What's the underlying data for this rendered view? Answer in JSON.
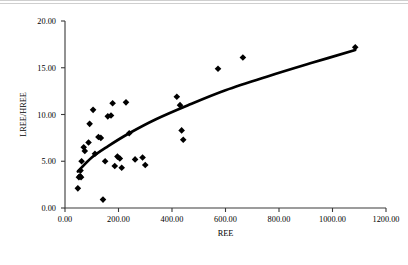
{
  "figure": {
    "background_color": "#ffffff",
    "marker_color": "#000000",
    "trend_color": "#000000",
    "axis_color": "#3a3a3a"
  },
  "chart_data": {
    "type": "scatter",
    "title": "",
    "xlabel": "REE",
    "ylabel": "LREE/HREE",
    "xlim": [
      0,
      1200
    ],
    "ylim": [
      0,
      20
    ],
    "grid": false,
    "legend": null,
    "xticks": [
      0,
      200,
      400,
      600,
      800,
      1000,
      1200
    ],
    "yticks": [
      0,
      5,
      10,
      15,
      20
    ],
    "xtick_labels": [
      "0.00",
      "200.00",
      "400.00",
      "600.00",
      "800.00",
      "1000.00",
      "1200.00"
    ],
    "ytick_labels": [
      "0.00",
      "5.00",
      "10.00",
      "15.00",
      "20.00"
    ],
    "marker_shape": "diamond",
    "points": [
      {
        "x": 48,
        "y": 2.1
      },
      {
        "x": 52,
        "y": 3.3
      },
      {
        "x": 56,
        "y": 3.4
      },
      {
        "x": 58,
        "y": 4.0
      },
      {
        "x": 60,
        "y": 3.3
      },
      {
        "x": 62,
        "y": 5.0
      },
      {
        "x": 70,
        "y": 6.5
      },
      {
        "x": 74,
        "y": 6.1
      },
      {
        "x": 88,
        "y": 7.0
      },
      {
        "x": 92,
        "y": 9.0
      },
      {
        "x": 105,
        "y": 10.5
      },
      {
        "x": 112,
        "y": 5.8
      },
      {
        "x": 125,
        "y": 7.6
      },
      {
        "x": 134,
        "y": 7.5
      },
      {
        "x": 142,
        "y": 0.9
      },
      {
        "x": 150,
        "y": 5.0
      },
      {
        "x": 160,
        "y": 9.8
      },
      {
        "x": 172,
        "y": 9.9
      },
      {
        "x": 178,
        "y": 11.2
      },
      {
        "x": 186,
        "y": 4.5
      },
      {
        "x": 196,
        "y": 5.5
      },
      {
        "x": 205,
        "y": 5.3
      },
      {
        "x": 212,
        "y": 4.3
      },
      {
        "x": 228,
        "y": 11.3
      },
      {
        "x": 240,
        "y": 8.0
      },
      {
        "x": 262,
        "y": 5.2
      },
      {
        "x": 290,
        "y": 5.4
      },
      {
        "x": 300,
        "y": 4.6
      },
      {
        "x": 418,
        "y": 11.9
      },
      {
        "x": 430,
        "y": 11.0
      },
      {
        "x": 436,
        "y": 8.3
      },
      {
        "x": 442,
        "y": 7.3
      },
      {
        "x": 572,
        "y": 14.9
      },
      {
        "x": 665,
        "y": 16.1
      },
      {
        "x": 1085,
        "y": 17.2
      }
    ],
    "trend_line": {
      "shape": "logarithmic",
      "points": [
        {
          "x": 48,
          "y": 3.9
        },
        {
          "x": 100,
          "y": 5.4
        },
        {
          "x": 160,
          "y": 6.6
        },
        {
          "x": 240,
          "y": 8.0
        },
        {
          "x": 340,
          "y": 9.5
        },
        {
          "x": 460,
          "y": 11.0
        },
        {
          "x": 600,
          "y": 12.6
        },
        {
          "x": 760,
          "y": 14.1
        },
        {
          "x": 920,
          "y": 15.5
        },
        {
          "x": 1085,
          "y": 16.9
        }
      ]
    }
  },
  "caption": {
    "text": ""
  }
}
